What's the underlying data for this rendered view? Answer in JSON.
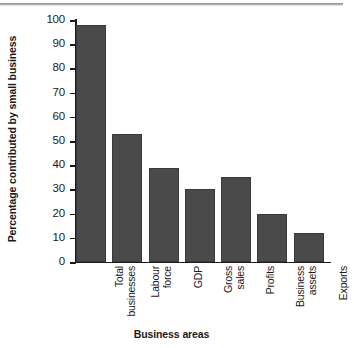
{
  "chart_data": {
    "type": "bar",
    "title": "",
    "xlabel": "Business areas",
    "ylabel": "Percentage contributed by small business",
    "ylim": [
      0,
      100
    ],
    "ytick_step": 10,
    "yticks": [
      "100",
      "90",
      "80",
      "70",
      "60",
      "50",
      "40",
      "30",
      "20",
      "10",
      "0"
    ],
    "grid": false,
    "legend": "none",
    "bar_color": "#4a4a4a",
    "bar_edge_color": "#3a3a3a",
    "background_color": "#ffffff",
    "axis_color": "#1a1a1a",
    "categories": [
      "Total businesses",
      "Labour force",
      "GDP",
      "Gross sales",
      "Profits",
      "Business assets",
      "Exports"
    ],
    "category_lines": [
      [
        "Total",
        "businesses"
      ],
      [
        "Labour",
        "force"
      ],
      [
        "GDP",
        ""
      ],
      [
        "Gross",
        "sales"
      ],
      [
        "Profits",
        ""
      ],
      [
        "Business",
        "assets"
      ],
      [
        "Exports",
        ""
      ]
    ],
    "values": [
      98,
      53,
      39,
      30,
      35,
      20,
      12
    ]
  }
}
